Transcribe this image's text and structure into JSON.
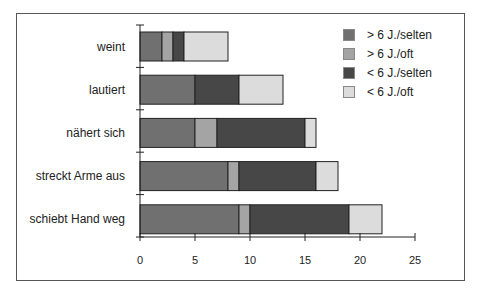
{
  "chart_data": {
    "type": "bar",
    "orientation": "horizontal",
    "stacked": true,
    "title": "",
    "xlabel": "",
    "ylabel": "",
    "xlim": [
      0,
      25
    ],
    "xticks": [
      0,
      5,
      10,
      15,
      20,
      25
    ],
    "grid": false,
    "legend_position": "upper right",
    "categories": [
      "weint",
      "lautiert",
      "nähert sich",
      "streckt Arme aus",
      "schiebt Hand weg"
    ],
    "series": [
      {
        "name": "> 6 J./selten",
        "color": "#707070",
        "values": [
          2,
          5,
          5,
          8,
          9
        ]
      },
      {
        "name": "> 6 J./oft",
        "color": "#a4a4a4",
        "values": [
          1,
          0,
          2,
          1,
          1
        ]
      },
      {
        "name": "< 6 J./selten",
        "color": "#474747",
        "values": [
          1,
          4,
          8,
          7,
          9
        ]
      },
      {
        "name": "< 6 J./oft",
        "color": "#dcdcdc",
        "values": [
          4,
          4,
          1,
          2,
          3
        ]
      }
    ]
  }
}
